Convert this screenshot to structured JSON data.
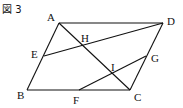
{
  "figure": {
    "title": "図 3",
    "points": [
      {
        "name": "A",
        "x": 59,
        "y": 23,
        "lx": 47,
        "ly": 21
      },
      {
        "name": "D",
        "x": 163,
        "y": 23,
        "lx": 167,
        "ly": 25
      },
      {
        "name": "B",
        "x": 27,
        "y": 90,
        "lx": 17,
        "ly": 99
      },
      {
        "name": "C",
        "x": 130,
        "y": 90,
        "lx": 134,
        "ly": 101
      },
      {
        "name": "E",
        "x": 44,
        "y": 56,
        "lx": 31,
        "ly": 58
      },
      {
        "name": "F",
        "x": 79,
        "y": 90,
        "lx": 73,
        "ly": 104
      },
      {
        "name": "G",
        "x": 146,
        "y": 56,
        "lx": 151,
        "ly": 62
      },
      {
        "name": "H",
        "x": 83,
        "y": 45,
        "lx": 81,
        "ly": 42
      },
      {
        "name": "I",
        "x": 112,
        "y": 74,
        "lx": 111,
        "ly": 71
      }
    ],
    "segments": [
      [
        "A",
        "D"
      ],
      [
        "D",
        "C"
      ],
      [
        "C",
        "B"
      ],
      [
        "B",
        "A"
      ],
      [
        "A",
        "C"
      ],
      [
        "E",
        "D"
      ],
      [
        "F",
        "G"
      ]
    ]
  }
}
